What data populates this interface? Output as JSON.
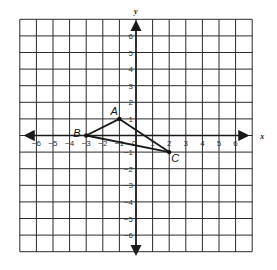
{
  "diagram": {
    "type": "coordinate-plane",
    "grid": {
      "xmin": -7,
      "xmax": 7,
      "ymin": -7,
      "ymax": 7,
      "step": 1
    },
    "axes": {
      "x_label": "x",
      "y_label": "y"
    },
    "x_ticks": [
      "-6",
      "-5",
      "-4",
      "-3",
      "-2",
      "-1",
      "0",
      "1",
      "2",
      "3",
      "4",
      "5",
      "6"
    ],
    "y_ticks": [
      "6",
      "5",
      "4",
      "3",
      "2",
      "1",
      "-1",
      "-2",
      "-3",
      "-4",
      "-5",
      "-6"
    ],
    "points": [
      {
        "label": "A",
        "x": -1,
        "y": 1
      },
      {
        "label": "B",
        "x": -3,
        "y": 0
      },
      {
        "label": "C",
        "x": 2,
        "y": -1
      }
    ],
    "segments": [
      [
        "A",
        "B"
      ],
      [
        "B",
        "C"
      ],
      [
        "C",
        "A"
      ]
    ],
    "colors": {
      "grid": "#2b2b2b",
      "axis": "#1a1a1a",
      "background": "#ffffff"
    }
  }
}
